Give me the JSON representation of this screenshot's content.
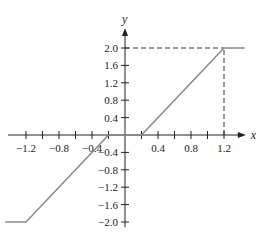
{
  "chart_data": {
    "type": "line",
    "title": "",
    "xlabel": "x",
    "ylabel": "y",
    "xlim": [
      -1.3,
      1.45
    ],
    "ylim": [
      -2.15,
      2.4
    ],
    "grid": false,
    "legend": null,
    "x_ticks": [
      -1.2,
      -1.0,
      -0.8,
      -0.6,
      -0.4,
      -0.2,
      0.2,
      0.4,
      0.6,
      0.8,
      1.0,
      1.2
    ],
    "x_tick_labels": [
      "−1.2",
      "−0.8",
      "−0.4",
      "0.4",
      "0.8",
      "1.2"
    ],
    "x_tick_label_values": [
      -1.2,
      -0.8,
      -0.4,
      0.4,
      0.8,
      1.2
    ],
    "y_ticks": [
      -2.0,
      -1.6,
      -1.2,
      -0.8,
      -0.4,
      0.4,
      0.8,
      1.2,
      1.6,
      2.0
    ],
    "y_tick_labels": [
      "−2.0",
      "−1.6",
      "−1.2",
      "−0.8",
      "−0.4",
      "0.4",
      "0.8",
      "1.2",
      "1.6",
      "2.0"
    ],
    "series": [
      {
        "name": "f(x)",
        "x": [
          -1.45,
          -1.2,
          -0.2,
          0.2,
          1.2,
          1.45
        ],
        "y": [
          -2.0,
          -2.0,
          0.0,
          0.0,
          2.0,
          2.0
        ],
        "color": "#888888"
      }
    ],
    "annotations": [
      {
        "type": "dashed-hline",
        "y": 2.0,
        "x_from": 0,
        "x_to": 1.2
      },
      {
        "type": "dashed-vline",
        "x": 1.2,
        "y_from": 0,
        "y_to": 2.0
      }
    ]
  },
  "colors": {
    "axis": "#222222",
    "curve": "#888888",
    "dashed": "#333333"
  }
}
